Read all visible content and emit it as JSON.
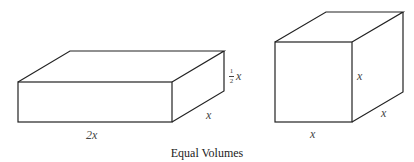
{
  "diagram": {
    "caption": "Equal Volumes",
    "left_box": {
      "name": "rectangular prism",
      "length_label": "2x",
      "depth_label": "x",
      "height_label_num": "1",
      "height_label_den": "2",
      "height_label_var": "x"
    },
    "right_box": {
      "name": "cube",
      "width_label": "x",
      "height_label": "x",
      "depth_label": "x"
    },
    "line_color": "#222222"
  }
}
